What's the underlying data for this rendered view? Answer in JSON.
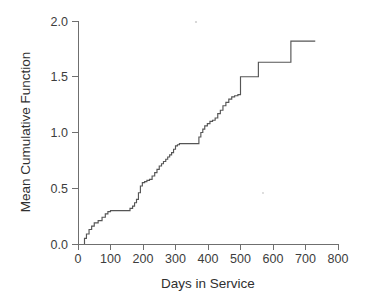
{
  "chart_data": {
    "type": "line",
    "subtype": "step-post",
    "title": "",
    "xlabel": "Days in Service",
    "ylabel": "Mean Cumulative Function",
    "xlim": [
      0,
      800
    ],
    "ylim": [
      0.0,
      2.0
    ],
    "xticks": [
      0,
      100,
      200,
      300,
      400,
      500,
      600,
      700,
      800
    ],
    "xtick_labels": [
      "0",
      "100",
      "200",
      "300",
      "400",
      "500",
      "600",
      "700",
      "800"
    ],
    "yticks": [
      0.0,
      0.5,
      1.0,
      1.5,
      2.0
    ],
    "ytick_labels": [
      "0.0",
      "0.5",
      "1.0",
      "1.5",
      "2.0"
    ],
    "grid": false,
    "legend": false,
    "legend_position": "none",
    "line_color": "#555555",
    "axis_color": "#6f6f6f",
    "background_color": "#ffffff",
    "series": [
      {
        "name": "Mean Cumulative Function",
        "x": [
          20,
          26,
          34,
          42,
          50,
          62,
          74,
          84,
          92,
          100,
          150,
          160,
          168,
          174,
          180,
          186,
          192,
          198,
          205,
          212,
          220,
          228,
          236,
          243,
          250,
          257,
          263,
          270,
          276,
          282,
          288,
          294,
          300,
          306,
          312,
          318,
          365,
          372,
          378,
          384,
          390,
          398,
          406,
          414,
          422,
          430,
          438,
          446,
          455,
          464,
          473,
          482,
          492,
          500,
          500,
          545,
          555,
          648,
          655,
          730
        ],
        "y": [
          0.05,
          0.09,
          0.13,
          0.16,
          0.19,
          0.21,
          0.24,
          0.27,
          0.29,
          0.3,
          0.3,
          0.32,
          0.34,
          0.37,
          0.4,
          0.46,
          0.52,
          0.55,
          0.56,
          0.57,
          0.58,
          0.61,
          0.64,
          0.67,
          0.7,
          0.72,
          0.74,
          0.76,
          0.78,
          0.8,
          0.82,
          0.85,
          0.88,
          0.89,
          0.9,
          0.9,
          0.9,
          0.96,
          1.0,
          1.03,
          1.06,
          1.08,
          1.1,
          1.11,
          1.13,
          1.17,
          1.2,
          1.24,
          1.27,
          1.3,
          1.32,
          1.33,
          1.34,
          1.35,
          1.5,
          1.5,
          1.63,
          1.63,
          1.82,
          1.82
        ],
        "final_value": 1.82,
        "start_value": 0.05
      }
    ]
  },
  "axes": {
    "x_title": "Days in Service",
    "y_title": "Mean Cumulative Function"
  }
}
